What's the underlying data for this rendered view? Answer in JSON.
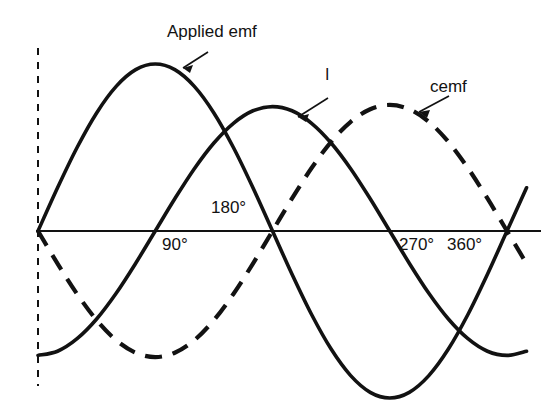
{
  "figure": {
    "kind": "ac-waveform-phase-diagram",
    "background_color": "#ffffff",
    "ink_color": "#121212"
  },
  "labels": {
    "applied_emf": "Applied emf",
    "current": "I",
    "cemf": "cemf"
  },
  "axis_ticks": {
    "deg90": "90°",
    "deg180": "180°",
    "deg270": "270°",
    "deg360": "360°"
  },
  "chart_data": {
    "type": "line",
    "title": "",
    "xlabel": "",
    "ylabel": "",
    "xlim": [
      0,
      380
    ],
    "ylim": [
      -1.12,
      1.12
    ],
    "grid": false,
    "legend": "inline-annotations",
    "x_tick_values": [
      90,
      180,
      270,
      360
    ],
    "x_tick_labels": [
      "90°",
      "180°",
      "270°",
      "360°"
    ],
    "x_tick_label_side": [
      "below",
      "above",
      "below",
      "below"
    ],
    "x": [
      0,
      15,
      30,
      45,
      60,
      75,
      90,
      105,
      120,
      135,
      150,
      165,
      180,
      195,
      210,
      225,
      240,
      255,
      270,
      285,
      300,
      315,
      330,
      345,
      360,
      375
    ],
    "series": [
      {
        "name": "Applied emf",
        "style": "solid",
        "color": "#121212",
        "phase_deg": 0,
        "amplitude": 1.0,
        "formula": "sin(x)",
        "values": [
          0,
          0.259,
          0.5,
          0.707,
          0.866,
          0.966,
          1.0,
          0.966,
          0.866,
          0.707,
          0.5,
          0.259,
          0,
          -0.259,
          -0.5,
          -0.707,
          -0.866,
          -0.966,
          -1.0,
          -0.966,
          -0.866,
          -0.707,
          -0.5,
          -0.259,
          0,
          0.259
        ]
      },
      {
        "name": "I",
        "style": "solid",
        "color": "#121212",
        "phase_deg": -90,
        "amplitude": 0.745,
        "formula": "-0.745*cos(x)",
        "values": [
          -0.745,
          -0.72,
          -0.645,
          -0.527,
          -0.373,
          -0.193,
          0,
          0.193,
          0.373,
          0.527,
          0.645,
          0.72,
          0.745,
          0.72,
          0.645,
          0.527,
          0.373,
          0.193,
          0,
          -0.193,
          -0.373,
          -0.527,
          -0.645,
          -0.72,
          -0.745,
          -0.72
        ]
      },
      {
        "name": "cemf",
        "style": "dashed",
        "color": "#121212",
        "phase_deg": 180,
        "amplitude": 0.755,
        "formula": "-0.755*sin(x)",
        "values": [
          0,
          -0.195,
          -0.377,
          -0.534,
          -0.654,
          -0.729,
          -0.755,
          -0.729,
          -0.654,
          -0.534,
          -0.377,
          -0.195,
          0,
          0.195,
          0.377,
          0.534,
          0.654,
          0.729,
          0.755,
          0.729,
          0.654,
          0.534,
          0.377,
          0.195,
          0,
          -0.195
        ]
      }
    ],
    "annotations": [
      {
        "text": "Applied emf",
        "points_to_series": "Applied emf",
        "arrow_direction": "down-left"
      },
      {
        "text": "I",
        "points_to_series": "I",
        "arrow_direction": "down-left"
      },
      {
        "text": "cemf",
        "points_to_series": "cemf",
        "arrow_direction": "down-left"
      }
    ],
    "reference_line": {
      "kind": "vertical-dashed",
      "at_x_deg": 0
    }
  }
}
